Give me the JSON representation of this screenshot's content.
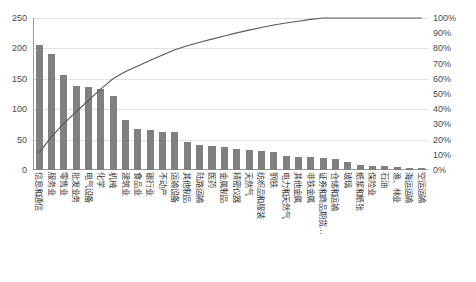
{
  "chart_data": {
    "type": "bar",
    "title": "",
    "subtitle": "",
    "xlabel": "",
    "ylabel": "",
    "y2label": "",
    "grid": true,
    "legend": "none",
    "ylim": [
      0,
      250
    ],
    "y2lim": [
      0,
      100
    ],
    "yticks": [
      "0",
      "50",
      "100",
      "150",
      "200",
      "250"
    ],
    "y2ticks": [
      "0%",
      "10%",
      "20%",
      "30%",
      "40%",
      "50%",
      "60%",
      "70%",
      "80%",
      "90%",
      "100%"
    ],
    "categories": [
      "信息和通信",
      "服务业",
      "零售业",
      "批发业务",
      "电气设备",
      "化学",
      "机械",
      "建筑业",
      "食品业",
      "银行业",
      "不动产",
      "运输设备",
      "其他制品",
      "陆路运输",
      "医药",
      "金属制品",
      "精密仪器",
      "天然气",
      "纺织品和服装",
      "钢铁",
      "电力和天然气",
      "其他金属",
      "非铁金属",
      "证券和商品期货…",
      "仓储和运输",
      "玻璃",
      "纸浆和纸张",
      "保险业",
      "石油",
      "渔、林业",
      "海运运输",
      "空运运输"
    ],
    "series": [
      {
        "name": "件数",
        "type": "bar",
        "axis": "left",
        "color": "#808080",
        "values": [
          205,
          190,
          157,
          138,
          137,
          134,
          122,
          82,
          68,
          66,
          63,
          62,
          46,
          41,
          39,
          38,
          35,
          33,
          31,
          30,
          23,
          22,
          21,
          20,
          18,
          13,
          9,
          7,
          6,
          5,
          4,
          3
        ]
      },
      {
        "name": "累计构成比",
        "type": "line",
        "axis": "right",
        "color": "#59595b",
        "values": [
          11.4,
          22.0,
          30.7,
          38.3,
          45.9,
          53.4,
          60.2,
          64.8,
          68.5,
          72.2,
          75.7,
          79.1,
          81.7,
          84.0,
          86.1,
          88.2,
          90.2,
          92.0,
          93.7,
          95.4,
          96.7,
          97.9,
          99.1,
          100.2,
          101.2,
          101.9,
          102.4,
          102.8,
          103.1,
          103.4,
          103.6,
          103.8
        ]
      }
    ],
    "cumulative_percent": [
      11,
      22,
      31,
      38,
      46,
      53,
      60,
      65,
      68,
      72,
      76,
      79,
      82,
      84,
      86,
      88,
      90,
      92,
      94,
      95,
      97,
      98,
      99,
      100,
      100,
      100,
      100,
      100,
      100,
      100,
      100,
      100
    ],
    "colors": {
      "bar": "#808080",
      "line": "#59595b",
      "grid": "#e2e2e2",
      "axis": "#9a9a9a",
      "text": "#4b4b4b",
      "background": "#ffffff"
    }
  }
}
